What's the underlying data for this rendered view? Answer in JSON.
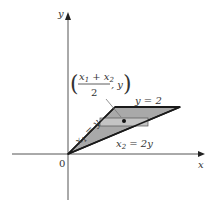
{
  "diagram": {
    "axes": {
      "x_label": "x",
      "y_label": "y",
      "origin_label": "0"
    },
    "region": {
      "description": "Triangular region bounded by x1 = y, x2 = 2y, and y = 2",
      "fill_color": "#a9a9a9",
      "edge_color": "#1a1a1a"
    },
    "labels": {
      "top_line": "y = 2",
      "left_line_var": "x",
      "left_line_sub": "1",
      "left_line_rest": " = y",
      "right_line_var": "x",
      "right_line_sub": "2",
      "right_line_rest": " = 2y",
      "midpoint_num_x1": "x",
      "midpoint_num_sub1": "1",
      "midpoint_num_plus": " + x",
      "midpoint_num_sub2": "2",
      "midpoint_den": "2",
      "midpoint_tail": ", y",
      "paren_open": "(",
      "paren_close": ")"
    },
    "strip": {
      "description": "Horizontal strip with marked midpoint",
      "fill_color": "#c4c4c4"
    }
  }
}
